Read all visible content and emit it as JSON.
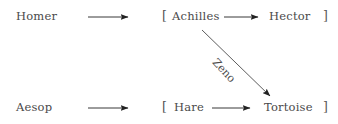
{
  "diagram": {
    "rows": [
      {
        "source": "Homer",
        "group_open": "[",
        "group_items": [
          "Achilles",
          "Hector"
        ],
        "group_close": "]"
      },
      {
        "source": "Aesop",
        "group_open": "[",
        "group_items": [
          "Hare",
          "Tortoise"
        ],
        "group_close": "]"
      }
    ],
    "edges": [
      {
        "from": "Homer",
        "to": "[Achilles, Hector]",
        "label": ""
      },
      {
        "from": "Achilles",
        "to": "Hector",
        "label": ""
      },
      {
        "from": "Aesop",
        "to": "[Hare, Tortoise]",
        "label": ""
      },
      {
        "from": "Hare",
        "to": "Tortoise",
        "label": ""
      },
      {
        "from": "Achilles",
        "to": "Tortoise",
        "label": "Zeno"
      }
    ],
    "colors": {
      "text": "#4a4a4a",
      "arrow": "#222222",
      "background": "#ffffff"
    }
  }
}
